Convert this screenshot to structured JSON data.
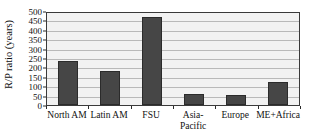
{
  "chart_data": {
    "type": "bar",
    "title": "",
    "xlabel": "",
    "ylabel": "R/P ratio (years)",
    "categories": [
      "North AM",
      "Latin AM",
      "FSU",
      "Asia-Pacific",
      "Europe",
      "ME+Africa"
    ],
    "category_lines": [
      [
        "North AM"
      ],
      [
        "Latin AM"
      ],
      [
        "FSU"
      ],
      [
        "Asia-",
        "Pacific"
      ],
      [
        "Europe"
      ],
      [
        "ME+Africa"
      ]
    ],
    "values": [
      235,
      180,
      470,
      57,
      52,
      125
    ],
    "ylim": [
      0,
      500
    ],
    "ytick_values": [
      0,
      50,
      100,
      150,
      200,
      250,
      300,
      350,
      400,
      450,
      500
    ],
    "ytick_labels": [
      "0",
      "50",
      "100",
      "150",
      "200",
      "250",
      "300",
      "350",
      "400",
      "450",
      "500"
    ],
    "grid": true,
    "legend": false,
    "legend_position": "none",
    "colors": {
      "bar_fill": "#464646",
      "bar_edge": "#2b2b2b",
      "plot_background": "#f2f2f2",
      "gridline": "#b9b9b9",
      "axis_border": "#3a3a3a",
      "text": "#111111"
    }
  }
}
